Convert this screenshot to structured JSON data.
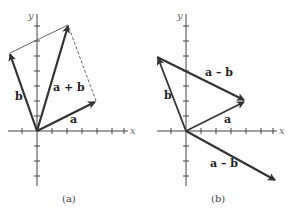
{
  "panels": [
    {
      "id": "a",
      "caption": "(a)",
      "x_axis_label": "x",
      "y_axis_label": "y",
      "vectors": [
        {
          "name": "a",
          "label": "a",
          "from": [
            0,
            0
          ],
          "to": [
            4,
            2
          ]
        },
        {
          "name": "b",
          "label": "b",
          "from": [
            0,
            0
          ],
          "to": [
            -2,
            5
          ]
        },
        {
          "name": "a+b",
          "label": "a + b",
          "from": [
            0,
            0
          ],
          "to": [
            2,
            7
          ]
        }
      ],
      "construction_lines": [
        {
          "style": "solid",
          "from": [
            -2,
            5
          ],
          "to": [
            2,
            7
          ]
        },
        {
          "style": "dashed",
          "from": [
            4,
            2
          ],
          "to": [
            2,
            7
          ]
        }
      ]
    },
    {
      "id": "b",
      "caption": "(b)",
      "x_axis_label": "x",
      "y_axis_label": "y",
      "vectors": [
        {
          "name": "a",
          "label": "a",
          "from": [
            0,
            0
          ],
          "to": [
            4,
            2
          ]
        },
        {
          "name": "b",
          "label": "b",
          "from": [
            0,
            0
          ],
          "to": [
            -2,
            5
          ]
        },
        {
          "name": "a-b-translated",
          "label": "a – b",
          "from": [
            -2,
            5
          ],
          "to": [
            4,
            2
          ]
        },
        {
          "name": "a-b",
          "label": "a – b",
          "from": [
            0,
            0
          ],
          "to": [
            6,
            -3
          ]
        }
      ]
    }
  ],
  "labels": {
    "a_caption": "(a)",
    "b_caption": "(b)",
    "x": "x",
    "y": "y",
    "vec_a": "a",
    "vec_b": "b",
    "vec_sum": "a + b",
    "vec_diff": "a – b"
  }
}
